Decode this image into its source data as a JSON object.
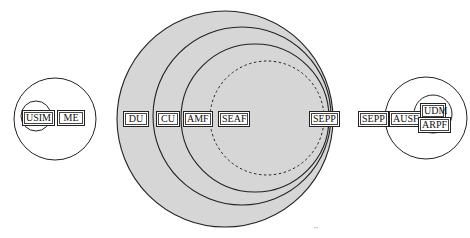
{
  "diagram": {
    "type": "nested-domain-diagram",
    "ue_domain": {
      "labels": [
        "USIM",
        "ME"
      ]
    },
    "serving_network": {
      "labels": [
        "DU",
        "CU",
        "AMF",
        "SEAF",
        "SEPP"
      ],
      "fill_color": "#d6d6d6"
    },
    "home_network": {
      "labels": [
        "SEPP",
        "AUSF",
        "UDM",
        "ARPF"
      ]
    },
    "footer_mark": "′′′"
  }
}
